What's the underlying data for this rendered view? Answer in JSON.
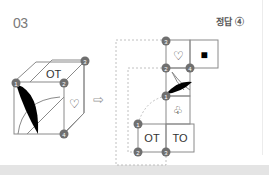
{
  "question": {
    "number": "03",
    "answer_label": "정답 ④"
  },
  "cube": {
    "top_face_text": "OT",
    "right_face_symbol": "♡",
    "front_face_symbol": "black-leaf",
    "vertex_labels": [
      "1",
      "2",
      "3",
      "4"
    ]
  },
  "arrow": "⇨",
  "net": {
    "cells": [
      {
        "id": "heart",
        "symbol": "♡"
      },
      {
        "id": "square",
        "symbol": "■"
      },
      {
        "id": "leaf",
        "symbol": "black-leaf"
      },
      {
        "id": "club",
        "symbol": "♧"
      },
      {
        "id": "ot",
        "symbol": "OT"
      },
      {
        "id": "to",
        "symbol": "TO"
      }
    ],
    "vertex_labels": {
      "top_left": "3",
      "mid_left": "2",
      "mid_right": "4",
      "leaf_bottom": "1",
      "row_left_top": "1",
      "row_left_bottom": "2",
      "row_mid_bottom": "3"
    }
  },
  "colors": {
    "vertex_fill": "#6f6f6f",
    "line": "#8a8a8a",
    "dashed": "#b0b0b0"
  }
}
